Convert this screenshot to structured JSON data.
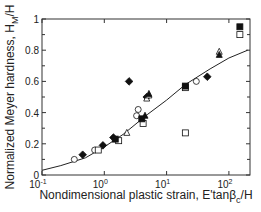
{
  "chart_data": {
    "type": "scatter",
    "title": "",
    "xlabel": "Nondimensional plastic strain, E'tanβc/H",
    "ylabel": "Normalized Meyer hardness, HM/H",
    "xscale": "log",
    "xlim": [
      0.1,
      200
    ],
    "ylim": [
      0,
      1
    ],
    "xticks": [
      "10^-1",
      "10^0",
      "10^1",
      "10^2"
    ],
    "yticks": [
      "0",
      "0.2",
      "0.4",
      "0.6",
      "0.8",
      "1"
    ],
    "grid": false,
    "legend": null,
    "series": [
      {
        "name": "open circle",
        "marker": "circle-open",
        "points": [
          [
            0.33,
            0.1
          ],
          [
            0.7,
            0.16
          ],
          [
            3.5,
            0.42
          ],
          [
            3.3,
            0.38
          ],
          [
            30,
            0.6
          ]
        ]
      },
      {
        "name": "filled diamond",
        "marker": "diamond-filled",
        "points": [
          [
            0.45,
            0.13
          ],
          [
            0.95,
            0.19
          ],
          [
            1.4,
            0.24
          ],
          [
            4.8,
            0.5
          ],
          [
            2.5,
            0.6
          ],
          [
            45,
            0.63
          ]
        ]
      },
      {
        "name": "open square",
        "marker": "square-open",
        "points": [
          [
            0.8,
            0.16
          ],
          [
            1.7,
            0.22
          ],
          [
            4.2,
            0.33
          ],
          [
            20,
            0.56
          ],
          [
            20,
            0.27
          ],
          [
            150,
            0.9
          ]
        ]
      },
      {
        "name": "filled square",
        "marker": "square-filled",
        "points": [
          [
            1.5,
            0.23
          ],
          [
            4.0,
            0.36
          ],
          [
            20,
            0.57
          ],
          [
            150,
            0.95
          ]
        ]
      },
      {
        "name": "open triangle",
        "marker": "triangle-open",
        "points": [
          [
            2.3,
            0.27
          ],
          [
            4.8,
            0.49
          ],
          [
            5.2,
            0.51
          ],
          [
            70,
            0.79
          ]
        ]
      },
      {
        "name": "filled triangle",
        "marker": "triangle-filled",
        "points": [
          [
            5.2,
            0.52
          ],
          [
            70,
            0.77
          ],
          [
            4.5,
            0.38
          ]
        ]
      }
    ],
    "fit_curve": {
      "name": "fit",
      "points": [
        [
          0.1,
          0.03
        ],
        [
          0.2,
          0.06
        ],
        [
          0.5,
          0.11
        ],
        [
          1,
          0.18
        ],
        [
          2,
          0.26
        ],
        [
          5,
          0.39
        ],
        [
          10,
          0.48
        ],
        [
          20,
          0.58
        ],
        [
          50,
          0.68
        ],
        [
          100,
          0.75
        ],
        [
          200,
          0.8
        ]
      ]
    }
  },
  "axes": {
    "x_tick_labels": [
      {
        "base": "10",
        "exp": "-1"
      },
      {
        "base": "10",
        "exp": "0"
      },
      {
        "base": "10",
        "exp": "1"
      },
      {
        "base": "10",
        "exp": "2"
      }
    ],
    "y_tick_labels": [
      "0",
      "0.2",
      "0.4",
      "0.6",
      "0.8",
      "1"
    ],
    "xlabel_main": "Nondimensional plastic strain, E'tanβ",
    "xlabel_sub": "c",
    "xlabel_tail": "/H",
    "ylabel_main": "Normalized Meyer hardness, H",
    "ylabel_sub": "M",
    "ylabel_tail": "/H"
  }
}
